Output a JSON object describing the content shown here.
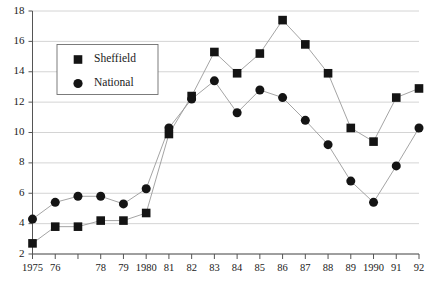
{
  "chart_data": {
    "type": "line",
    "title": "",
    "subtitle": "",
    "xlabel": "",
    "ylabel": "",
    "x": [
      1975,
      1976,
      1977,
      1978,
      1979,
      1980,
      1981,
      1982,
      1983,
      1984,
      1985,
      1986,
      1987,
      1988,
      1989,
      1990,
      1991,
      1992
    ],
    "categories": [
      "1975",
      "76",
      "",
      "78",
      "79",
      "1980",
      "81",
      "82",
      "83",
      "84",
      "85",
      "86",
      "87",
      "88",
      "89",
      "1990",
      "91",
      "92"
    ],
    "xtick_labels": [
      "1975",
      "76",
      "",
      "78",
      "79",
      "1980",
      "81",
      "82",
      "83",
      "84",
      "85",
      "86",
      "87",
      "88",
      "89",
      "1990",
      "91",
      "92"
    ],
    "ytick_labels": [
      "2",
      "4",
      "6",
      "8",
      "10",
      "12",
      "14",
      "16",
      "18"
    ],
    "yticks": [
      2,
      4,
      6,
      8,
      10,
      12,
      14,
      16,
      18
    ],
    "ylim": [
      2,
      18
    ],
    "xlim": [
      1975,
      1992
    ],
    "grid": "horizontal",
    "legend_position": "upper-left-inside",
    "series": [
      {
        "name": "Sheffield",
        "marker": "square",
        "color": "#141414",
        "values": [
          2.7,
          3.8,
          3.8,
          4.2,
          4.2,
          4.7,
          9.9,
          12.4,
          15.3,
          13.9,
          15.2,
          17.4,
          15.8,
          13.9,
          10.3,
          9.4,
          12.3,
          12.9
        ]
      },
      {
        "name": "National",
        "marker": "circle",
        "color": "#141414",
        "values": [
          4.3,
          5.4,
          5.8,
          5.8,
          5.3,
          6.3,
          10.3,
          12.2,
          13.4,
          11.3,
          12.8,
          12.3,
          10.8,
          9.2,
          6.8,
          5.4,
          7.8,
          10.3
        ]
      }
    ]
  },
  "legend": {
    "entries": [
      {
        "label": "Sheffield",
        "marker": "square"
      },
      {
        "label": "National",
        "marker": "circle"
      }
    ]
  }
}
